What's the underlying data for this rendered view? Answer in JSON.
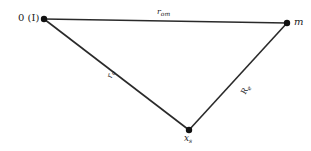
{
  "diagram": {
    "type": "triangle",
    "colors": {
      "line": "#2a2a2a",
      "node": "#111111",
      "text": "#222222"
    },
    "nodes": [
      {
        "id": "origin",
        "label": "0 (I)",
        "x": 44,
        "y": 19
      },
      {
        "id": "m",
        "label": "m",
        "x": 287,
        "y": 23
      },
      {
        "id": "xs",
        "label_main": "x",
        "label_sub": "s",
        "x": 189,
        "y": 130
      }
    ],
    "edges": [
      {
        "from": "origin",
        "to": "m",
        "label_main": "r",
        "label_sub": "om"
      },
      {
        "from": "origin",
        "to": "xs",
        "label_main": "r",
        "label_sub": "o"
      },
      {
        "from": "m",
        "to": "xs",
        "label_main": "R",
        "label_sub": "e"
      }
    ]
  }
}
